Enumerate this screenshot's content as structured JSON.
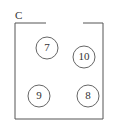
{
  "diagram": {
    "label": "C",
    "box": {
      "left": 15,
      "top": 23,
      "right": 103,
      "bottom": 119,
      "gap_start": 46,
      "gap_end": 83
    },
    "circles": [
      {
        "value": "7",
        "cx": 47,
        "cy": 48,
        "r": 11
      },
      {
        "value": "10",
        "cx": 84,
        "cy": 57,
        "r": 11
      },
      {
        "value": "9",
        "cx": 39,
        "cy": 96,
        "r": 11
      },
      {
        "value": "8",
        "cx": 88,
        "cy": 96,
        "r": 11
      }
    ],
    "colors": {
      "stroke": "#555555",
      "text": "#333333"
    }
  }
}
